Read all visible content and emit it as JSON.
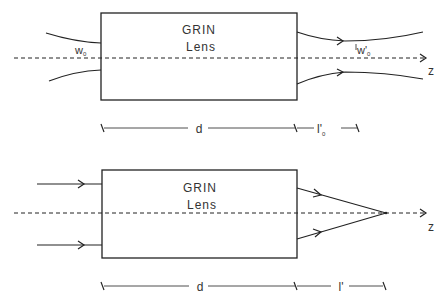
{
  "diagram_top": {
    "lens_label_line1": "GRIN",
    "lens_label_line2": "Lens",
    "input_waist_label": "w",
    "input_waist_sub": "0",
    "output_waist_label": "w'",
    "output_waist_sub": "0",
    "axis_label": "z",
    "dim_lens_length": "d",
    "dim_image_distance": "l'",
    "dim_image_distance_sub": "0"
  },
  "diagram_bottom": {
    "lens_label_line1": "GRIN",
    "lens_label_line2": "Lens",
    "axis_label": "z",
    "dim_lens_length": "d",
    "dim_focal_distance": "l'"
  },
  "colors": {
    "line": "#222222",
    "text": "#333333",
    "background": "#ffffff"
  }
}
